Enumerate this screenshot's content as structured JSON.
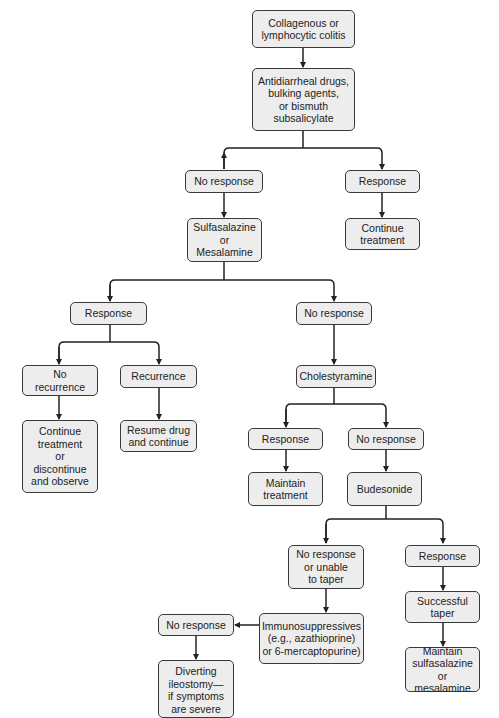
{
  "diagram": {
    "type": "flowchart",
    "colors": {
      "box_fill": "#ededed",
      "box_border": "#3a3a3a",
      "line": "#222222",
      "text": "#222222"
    },
    "nodes": {
      "start": "Collagenous or\nlymphocytic colitis",
      "antidiarrheal": "Antidiarrheal drugs,\nbulking agents,\nor bismuth\nsubsalicylate",
      "no_response_1": "No response",
      "response_1": "Response",
      "sulfasalazine": "Sulfasalazine\nor\nMesalamine",
      "continue_treatment": "Continue\ntreatment",
      "response_2": "Response",
      "no_response_2": "No response",
      "no_recurrence": "No\nrecurrence",
      "recurrence": "Recurrence",
      "continue_or_discontinue": "Continue\ntreatment\nor\ndiscontinue\nand observe",
      "resume_drug": "Resume drug\nand continue",
      "cholestyramine": "Cholestyramine",
      "response_3": "Response",
      "no_response_3": "No response",
      "maintain_treatment": "Maintain\ntreatment",
      "budesonide": "Budesonide",
      "no_response_taper": "No response\nor unable\nto taper",
      "response_4": "Response",
      "immunosuppressives": "Immunosuppressives\n(e.g., azathioprine)\nor 6-mercaptopurine)",
      "successful_taper": "Successful\ntaper",
      "no_response_4": "No response",
      "maintain_sulfasalazine": "Maintain\nsulfasalazine or\nmesalamine",
      "diverting_ileostomy": "Diverting\nileostomy—\nif symptoms\nare severe"
    },
    "edges": [
      [
        "start",
        "antidiarrheal"
      ],
      [
        "antidiarrheal",
        "no_response_1"
      ],
      [
        "antidiarrheal",
        "response_1"
      ],
      [
        "no_response_1",
        "sulfasalazine"
      ],
      [
        "response_1",
        "continue_treatment"
      ],
      [
        "sulfasalazine",
        "response_2"
      ],
      [
        "sulfasalazine",
        "no_response_2"
      ],
      [
        "response_2",
        "no_recurrence"
      ],
      [
        "response_2",
        "recurrence"
      ],
      [
        "no_recurrence",
        "continue_or_discontinue"
      ],
      [
        "recurrence",
        "resume_drug"
      ],
      [
        "no_response_2",
        "cholestyramine"
      ],
      [
        "cholestyramine",
        "response_3"
      ],
      [
        "cholestyramine",
        "no_response_3"
      ],
      [
        "response_3",
        "maintain_treatment"
      ],
      [
        "no_response_3",
        "budesonide"
      ],
      [
        "budesonide",
        "no_response_taper"
      ],
      [
        "budesonide",
        "response_4"
      ],
      [
        "no_response_taper",
        "immunosuppressives"
      ],
      [
        "response_4",
        "successful_taper"
      ],
      [
        "successful_taper",
        "maintain_sulfasalazine"
      ],
      [
        "immunosuppressives",
        "no_response_4"
      ],
      [
        "no_response_4",
        "diverting_ileostomy"
      ]
    ]
  }
}
